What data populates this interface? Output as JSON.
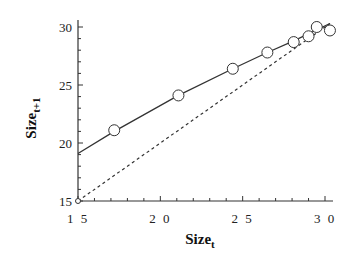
{
  "chart_data": {
    "type": "scatter",
    "title": "",
    "xlabel": "Size",
    "xlabel_subscript": "t",
    "ylabel": "Size",
    "ylabel_subscript": "t+1",
    "xlim": [
      15,
      30.5
    ],
    "ylim": [
      15,
      30.5
    ],
    "x_ticks": [
      "15",
      "20",
      "25",
      "30"
    ],
    "y_ticks": [
      "15",
      "20",
      "25",
      "30"
    ],
    "grid": false,
    "legend": null,
    "series": [
      {
        "name": "observed",
        "style": "open-circles",
        "points": [
          [
            17.2,
            21.1
          ],
          [
            21.1,
            24.1
          ],
          [
            24.4,
            26.4
          ],
          [
            26.5,
            27.8
          ],
          [
            28.1,
            28.7
          ],
          [
            29.0,
            29.2
          ],
          [
            29.5,
            30.0
          ],
          [
            30.3,
            29.7
          ]
        ]
      },
      {
        "name": "fitted curve",
        "style": "solid-line",
        "points": [
          [
            15.0,
            19.1
          ],
          [
            17.2,
            21.0
          ],
          [
            21.1,
            24.1
          ],
          [
            24.4,
            26.4
          ],
          [
            26.5,
            27.8
          ],
          [
            28.1,
            28.8
          ],
          [
            30.3,
            30.3
          ]
        ]
      },
      {
        "name": "1:1 line",
        "style": "dashed-line",
        "points": [
          [
            15,
            15
          ],
          [
            30.3,
            30.3
          ]
        ]
      }
    ]
  }
}
